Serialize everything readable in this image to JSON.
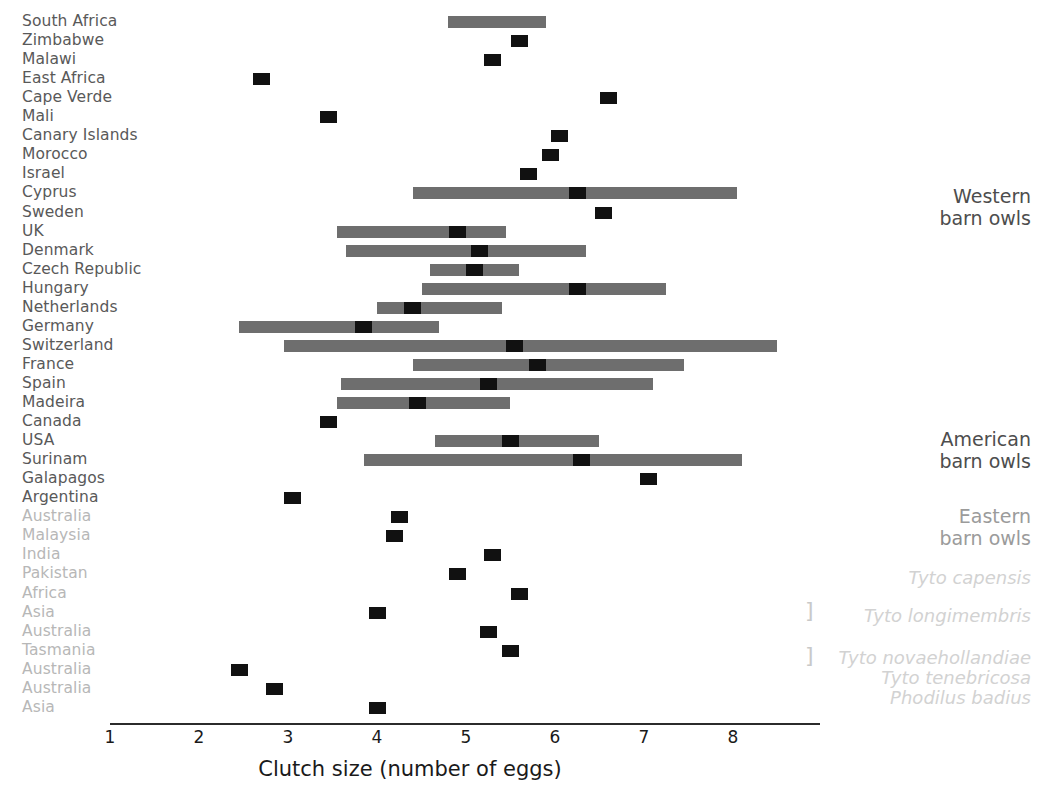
{
  "chart_data": {
    "type": "bar",
    "orientation": "horizontal",
    "title": "",
    "xlabel": "Clutch size (number of eggs)",
    "ylabel": "",
    "xlim": [
      1,
      9
    ],
    "xticks": [
      1,
      2,
      3,
      4,
      5,
      6,
      7,
      8
    ],
    "xtick_labels": [
      "1",
      "2",
      "3",
      "4",
      "5",
      "6",
      "7",
      "8"
    ],
    "grid": false,
    "legend": "none",
    "marker_style": "black square (mean clutch size)",
    "range_style": "grey horizontal bar (min-max range)",
    "colors": {
      "range_bar": "#6e6e6e",
      "marker": "#111111",
      "label": "#595959",
      "label_faded": "#b7b7b7",
      "group_label": "#4d4d4d",
      "species_label": "#d2d2d2",
      "axis": "#2b2b2b"
    },
    "categories": [
      "South Africa",
      "Zimbabwe",
      "Malawi",
      "East Africa",
      "Cape Verde",
      "Mali",
      "Canary Islands",
      "Morocco",
      "Israel",
      "Cyprus",
      "Sweden",
      "UK",
      "Denmark",
      "Czech Republic",
      "Hungary",
      "Netherlands",
      "Germany",
      "Switzerland",
      "France",
      "Spain",
      "Madeira",
      "Canada",
      "USA",
      "Surinam",
      "Galapagos",
      "Argentina",
      "Australia",
      "Malaysia",
      "India",
      "Pakistan",
      "Africa",
      "Asia",
      "Australia",
      "Tasmania",
      "Australia",
      "Australia",
      "Asia"
    ],
    "rows": [
      {
        "label": "South Africa",
        "faded": false,
        "mean": null,
        "range": [
          4.8,
          5.9
        ]
      },
      {
        "label": "Zimbabwe",
        "faded": false,
        "mean": 5.6,
        "range": null
      },
      {
        "label": "Malawi",
        "faded": false,
        "mean": 5.3,
        "range": null
      },
      {
        "label": "East Africa",
        "faded": false,
        "mean": 2.7,
        "range": null
      },
      {
        "label": "Cape Verde",
        "faded": false,
        "mean": 6.6,
        "range": null
      },
      {
        "label": "Mali",
        "faded": false,
        "mean": 3.45,
        "range": null
      },
      {
        "label": "Canary Islands",
        "faded": false,
        "mean": 6.05,
        "range": null
      },
      {
        "label": "Morocco",
        "faded": false,
        "mean": 5.95,
        "range": null
      },
      {
        "label": "Israel",
        "faded": false,
        "mean": 5.7,
        "range": null
      },
      {
        "label": "Cyprus",
        "faded": false,
        "mean": 6.25,
        "range": [
          4.4,
          8.05
        ]
      },
      {
        "label": "Sweden",
        "faded": false,
        "mean": 6.55,
        "range": null
      },
      {
        "label": "UK",
        "faded": false,
        "mean": 4.9,
        "range": [
          3.55,
          5.45
        ]
      },
      {
        "label": "Denmark",
        "faded": false,
        "mean": 5.15,
        "range": [
          3.65,
          6.35
        ]
      },
      {
        "label": "Czech Republic",
        "faded": false,
        "mean": 5.1,
        "range": [
          4.6,
          5.6
        ]
      },
      {
        "label": "Hungary",
        "faded": false,
        "mean": 6.25,
        "range": [
          4.5,
          7.25
        ]
      },
      {
        "label": "Netherlands",
        "faded": false,
        "mean": 4.4,
        "range": [
          4.0,
          5.4
        ]
      },
      {
        "label": "Germany",
        "faded": false,
        "mean": 3.85,
        "range": [
          2.45,
          4.7
        ]
      },
      {
        "label": "Switzerland",
        "faded": false,
        "mean": 5.55,
        "range": [
          2.95,
          8.5
        ]
      },
      {
        "label": "France",
        "faded": false,
        "mean": 5.8,
        "range": [
          4.4,
          7.45
        ]
      },
      {
        "label": "Spain",
        "faded": false,
        "mean": 5.25,
        "range": [
          3.6,
          7.1
        ]
      },
      {
        "label": "Madeira",
        "faded": false,
        "mean": 4.45,
        "range": [
          3.55,
          5.5
        ]
      },
      {
        "label": "Canada",
        "faded": false,
        "mean": 3.45,
        "range": null
      },
      {
        "label": "USA",
        "faded": false,
        "mean": 5.5,
        "range": [
          4.65,
          6.5
        ]
      },
      {
        "label": "Surinam",
        "faded": false,
        "mean": 6.3,
        "range": [
          3.85,
          8.1
        ]
      },
      {
        "label": "Galapagos",
        "faded": false,
        "mean": 7.05,
        "range": null
      },
      {
        "label": "Argentina",
        "faded": false,
        "mean": 3.05,
        "range": null
      },
      {
        "label": "Australia",
        "faded": true,
        "mean": 4.25,
        "range": null
      },
      {
        "label": "Malaysia",
        "faded": true,
        "mean": 4.2,
        "range": null
      },
      {
        "label": "India",
        "faded": true,
        "mean": 5.3,
        "range": null
      },
      {
        "label": "Pakistan",
        "faded": true,
        "mean": 4.9,
        "range": null
      },
      {
        "label": "Africa",
        "faded": true,
        "mean": 5.6,
        "range": null
      },
      {
        "label": "Asia",
        "faded": true,
        "mean": 4.0,
        "range": null
      },
      {
        "label": "Australia",
        "faded": true,
        "mean": 5.25,
        "range": null
      },
      {
        "label": "Tasmania",
        "faded": true,
        "mean": 5.5,
        "range": null
      },
      {
        "label": "Australia",
        "faded": true,
        "mean": 2.45,
        "range": null
      },
      {
        "label": "Australia",
        "faded": true,
        "mean": 2.85,
        "range": null
      },
      {
        "label": "Asia",
        "faded": true,
        "mean": 4.0,
        "range": null
      }
    ],
    "group_annotations": [
      {
        "lines": [
          "Western",
          "barn owls"
        ],
        "faded": false,
        "italic": false,
        "top": 185,
        "rows": [
          0,
          25
        ]
      },
      {
        "lines": [
          "American",
          "barn owls"
        ],
        "faded": false,
        "italic": false,
        "top": 428,
        "rows": [
          21,
          25
        ]
      },
      {
        "lines": [
          "Eastern",
          "barn owls"
        ],
        "faded": true,
        "italic": false,
        "top": 505,
        "rows": [
          26,
          29
        ]
      },
      {
        "lines": [
          "Tyto capensis"
        ],
        "faded": true,
        "italic": true,
        "top": 568,
        "rows": [
          30,
          30
        ]
      },
      {
        "lines": [
          "Tyto longimembris"
        ],
        "faded": true,
        "italic": true,
        "top": 606,
        "rows": [
          31,
          32
        ]
      },
      {
        "lines": [
          "Tyto novaehollandiae"
        ],
        "faded": true,
        "italic": true,
        "top": 648,
        "rows": [
          33,
          34
        ]
      },
      {
        "lines": [
          "Tyto tenebricosa"
        ],
        "faded": true,
        "italic": true,
        "top": 668,
        "rows": [
          35,
          35
        ]
      },
      {
        "lines": [
          "Phodilus badius"
        ],
        "faded": true,
        "italic": true,
        "top": 688,
        "rows": [
          36,
          36
        ]
      }
    ],
    "brackets": [
      {
        "glyph": "]",
        "top": 600
      },
      {
        "glyph": "]",
        "top": 645
      }
    ]
  },
  "axis": {
    "title": "Clutch size (number of eggs)",
    "ticks": [
      "1",
      "2",
      "3",
      "4",
      "5",
      "6",
      "7",
      "8"
    ]
  }
}
